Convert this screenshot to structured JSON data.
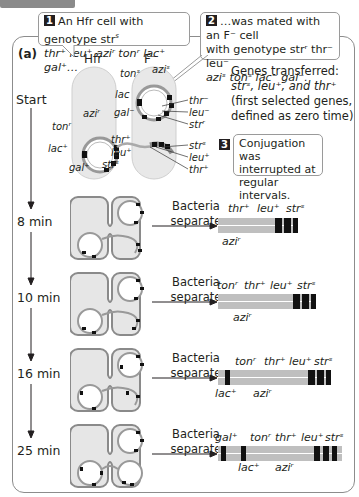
{
  "header": {
    "tab_label": "Methods"
  },
  "panel": {
    "label": "(a)"
  },
  "callouts": [
    {
      "number": "1",
      "text_line1": "An Hfr cell with genotype str",
      "sup1": "s",
      "text_line2": "thr⁺ leu⁺ aziʳ tonʳ lac⁺ gal⁺…"
    },
    {
      "number": "2",
      "text_line1": "…was mated with an F⁻ cell",
      "text_line2": "with genotype strʳ thr⁻ leu⁻",
      "text_line3": "aziˢ tonˢ lac⁻ gal⁻."
    },
    {
      "number": "3",
      "text_line1": "Conjugation was",
      "text_line2": "interrupted at",
      "text_line3": "regular intervals."
    }
  ],
  "genes_transferred": {
    "line1": "Genes transferred:",
    "line2": "strˢ, leu⁺, and thr⁺",
    "line3": "(first selected genes,",
    "line4": "defined as zero time)"
  },
  "cell_labels": {
    "hfr": "Hfr",
    "fminus": "F⁻"
  },
  "start_genes": {
    "hfr": [
      "aziʳ",
      "tonʳ",
      "lac⁺",
      "gal⁺",
      "thr⁺",
      "leu⁺",
      "strˢ"
    ],
    "fminus": [
      "tonˢ",
      "aziˢ",
      "lac",
      "gal⁻",
      "thr⁻",
      "leu⁻",
      "strʳ"
    ],
    "transferred": [
      "strˢ",
      "leu⁺",
      "thr⁺"
    ]
  },
  "timeline": [
    {
      "time": "Start"
    },
    {
      "time": "8 min",
      "action": "Bacteria separate",
      "genes_top": [
        "thr⁺",
        "leu⁺",
        "strˢ"
      ],
      "genes_bottom": [
        "aziʳ"
      ]
    },
    {
      "time": "10 min",
      "action": "Bacteria separate",
      "genes_top": [
        "tonʳ",
        "thr⁺",
        "leu⁺",
        "strˢ"
      ],
      "genes_bottom": [
        "aziʳ"
      ]
    },
    {
      "time": "16 min",
      "action": "Bacteria separate",
      "genes_top": [
        "tonʳ",
        "thr⁺",
        "leu⁺",
        "strˢ"
      ],
      "genes_bottom": [
        "lac⁺",
        "aziʳ"
      ]
    },
    {
      "time": "25 min",
      "action": "Bacteria separate",
      "genes_top": [
        "gal⁺",
        "tonʳ",
        "thr⁺",
        "leu⁺",
        "strˢ"
      ],
      "genes_bottom": [
        "lac⁺",
        "aziʳ"
      ]
    }
  ],
  "colors": {
    "cell_fill": "#e6e6e6",
    "cell_border": "#9a9a9a",
    "dna_gray": "#b8b8b8",
    "marker": "#1a1a1a",
    "panel_border": "#8c8c8c"
  }
}
